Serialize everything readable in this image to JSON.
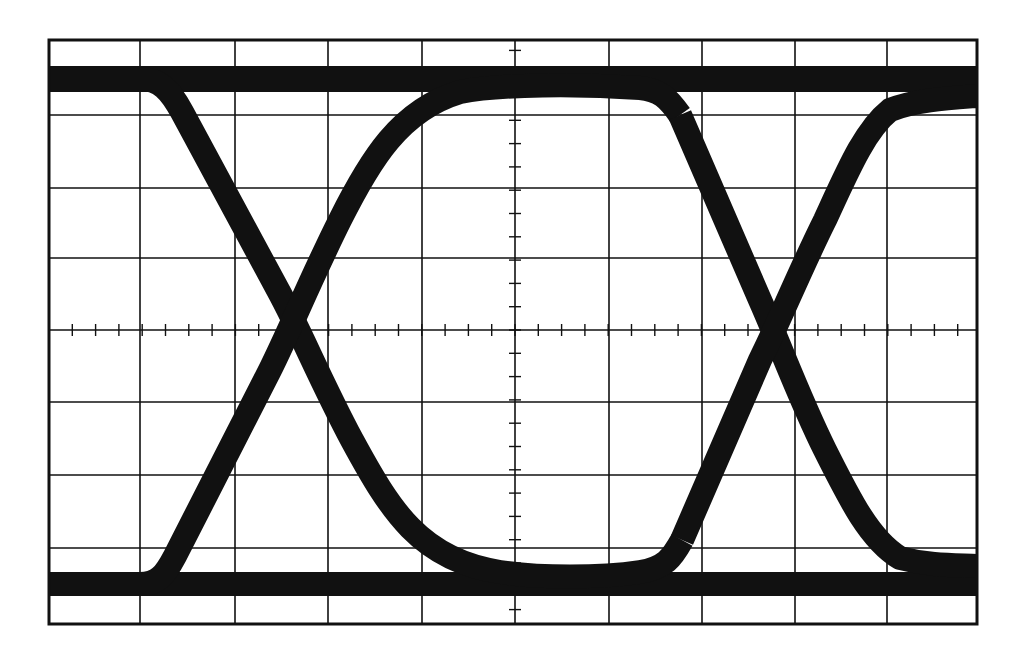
{
  "figure": {
    "kind": "oscilloscope eye diagram",
    "background": "#ffffff",
    "ink": "#111111",
    "graticule": {
      "left": 49,
      "top": 40,
      "right": 977,
      "bottom": 624,
      "vertical_lines_x": [
        140,
        235,
        328,
        422,
        515,
        609,
        702,
        795,
        887
      ],
      "horizontal_lines_y": [
        115,
        188,
        258,
        330,
        402,
        475,
        548
      ],
      "center_x": 515,
      "center_y": 330,
      "minor_tick_spacing": 23.3,
      "minor_tick_length": 12
    },
    "traces": {
      "stroke_width": 24,
      "top_rail": {
        "y": 79,
        "height": 26
      },
      "bottom_rail": {
        "y": 584,
        "height": 24
      },
      "paths": [
        {
          "name": "falling-edge-1",
          "d": "M 140 79 C 160 79, 170 90, 182 112 L 278 290 C 300 330, 320 380, 352 440 C 390 510, 420 560, 500 572 C 540 578, 600 578, 640 572 C 665 568, 672 558, 682 540"
        },
        {
          "name": "rising-edge-1",
          "d": "M 140 584 C 158 584, 165 575, 175 556 L 270 370 C 290 330, 310 280, 340 220 C 370 160, 400 110, 460 92 C 500 84, 580 84, 640 88 C 660 90, 668 98, 680 115"
        },
        {
          "name": "falling-edge-2",
          "d": "M 680 115 L 760 300 C 780 345, 800 400, 825 450 C 850 500, 870 540, 900 558 C 930 566, 955 565, 977 566"
        },
        {
          "name": "rising-edge-2",
          "d": "M 682 540 L 760 360 C 780 320, 800 270, 825 220 C 848 170, 865 130, 890 110 C 915 100, 950 98, 977 96"
        }
      ]
    }
  }
}
